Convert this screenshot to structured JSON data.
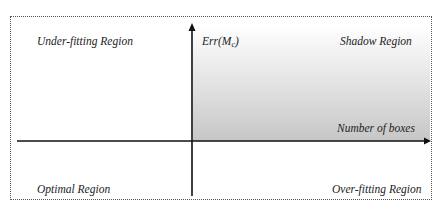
{
  "diagram": {
    "regions": {
      "top_left": "Under-fitting Region",
      "top_right": "Shadow Region",
      "bottom_left": "Optimal Region",
      "bottom_right": "Over-fitting Region"
    },
    "axes": {
      "y_label_main": "Err(M",
      "y_label_sub": "c",
      "y_label_close": ")",
      "x_label": "Number of boxes"
    },
    "colors": {
      "axis": "#111111",
      "shade_top": "#ffffff",
      "shade_bottom": "#c6c6c6",
      "border": "#555555"
    }
  }
}
